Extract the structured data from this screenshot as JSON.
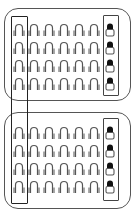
{
  "diagram": {
    "panels": [
      {
        "name": "top-panel",
        "rows": 4,
        "cols": 7,
        "highlighted_last_col": true
      },
      {
        "name": "bottom-panel",
        "rows": 4,
        "cols": 7,
        "highlighted_last_col": true
      }
    ],
    "icon": "open-padlock-icon",
    "special_icon": "filled-top-padlock-icon",
    "colors": {
      "stroke": "#555555",
      "frame": "#222222",
      "fill": "#111111",
      "background": "#ffffff"
    }
  }
}
